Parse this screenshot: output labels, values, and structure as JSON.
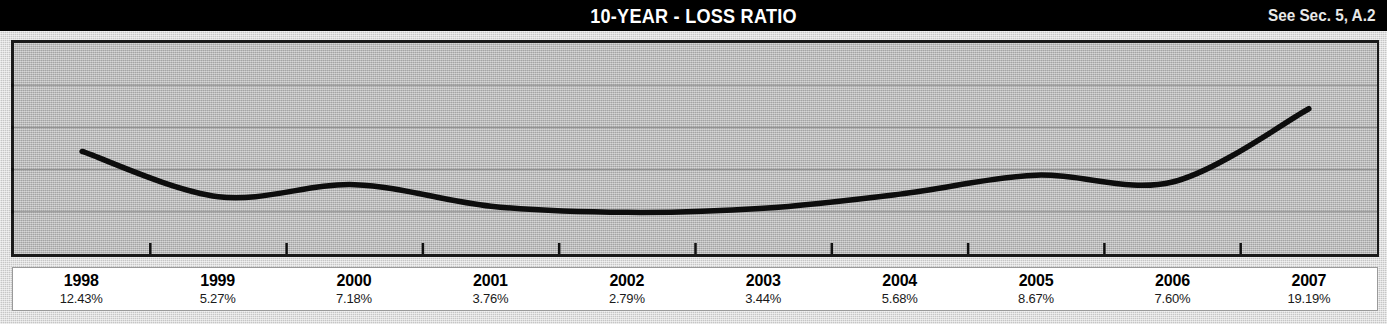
{
  "header": {
    "title": "10-YEAR - LOSS RATIO",
    "note": "See Sec. 5, A.2"
  },
  "chart_data": {
    "type": "line",
    "title": "10-YEAR - LOSS RATIO",
    "xlabel": "",
    "ylabel": "",
    "grid": true,
    "gridlines": 4,
    "legend": "none",
    "line_color": "#000000",
    "plot_background": "#b3b3b3",
    "categories": [
      "1998",
      "1999",
      "2000",
      "2001",
      "2002",
      "2003",
      "2004",
      "2005",
      "2006",
      "2007"
    ],
    "values": [
      12.43,
      5.27,
      7.18,
      3.76,
      2.79,
      3.44,
      5.68,
      8.67,
      7.6,
      19.19
    ],
    "value_labels": [
      "12.43%",
      "5.27%",
      "7.18%",
      "3.76%",
      "2.79%",
      "3.44%",
      "5.68%",
      "8.67%",
      "7.60%",
      "19.19%"
    ],
    "ylim": [
      0,
      22
    ],
    "points": [
      {
        "year": "1998",
        "value": 12.43,
        "label": "12.43%"
      },
      {
        "year": "1999",
        "value": 5.27,
        "label": "5.27%"
      },
      {
        "year": "2000",
        "value": 7.18,
        "label": "7.18%"
      },
      {
        "year": "2001",
        "value": 3.76,
        "label": "3.76%"
      },
      {
        "year": "2002",
        "value": 2.79,
        "label": "2.79%"
      },
      {
        "year": "2003",
        "value": 3.44,
        "label": "3.44%"
      },
      {
        "year": "2004",
        "value": 5.68,
        "label": "5.68%"
      },
      {
        "year": "2005",
        "value": 8.67,
        "label": "8.67%"
      },
      {
        "year": "2006",
        "value": 7.6,
        "label": "7.60%"
      },
      {
        "year": "2007",
        "value": 19.19,
        "label": "19.19%"
      }
    ]
  }
}
